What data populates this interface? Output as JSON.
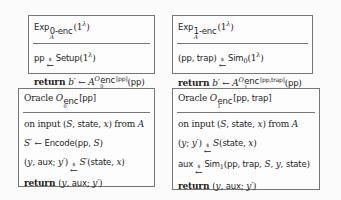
{
  "figure": {
    "colors": {
      "page_bg": "#fbfbfb",
      "box_bg": "#fdfdfd",
      "border": "#767676",
      "ink": "#1f1f1f"
    },
    "boxes": [
      {
        "name": "experiment-0-enc",
        "title": [
          {
            "t": "Exp",
            "c": "sf"
          },
          {
            "k": "stack",
            "c": "",
            "sup": [
              {
                "t": "0-enc",
                "c": "sf"
              }
            ],
            "sub": [
              {
                "t": "A",
                "c": "cal"
              }
            ]
          },
          {
            "t": "(1",
            "c": "rm"
          },
          {
            "t": "λ",
            "c": "sup it"
          },
          {
            "t": ")",
            "c": "rm"
          }
        ],
        "lines": [
          [
            {
              "t": "pp",
              "c": "sf"
            },
            {
              "k": "sarr",
              "t": "$"
            },
            {
              "t": "Setup",
              "c": "sf"
            },
            {
              "t": "(1",
              "c": "rm"
            },
            {
              "t": "λ",
              "c": "sup it"
            },
            {
              "t": ")",
              "c": "rm"
            }
          ],
          [
            {
              "t": "return ",
              "c": "bf"
            },
            {
              "t": "b′",
              "c": "it"
            },
            {
              "t": " ← ",
              "c": "rm"
            },
            {
              "t": "A",
              "c": "cal"
            },
            {
              "t": "O",
              "c": "sup cal"
            },
            {
              "k": "stack",
              "c": "ss hi",
              "sup": [
                {
                  "t": "enc",
                  "c": "sf"
                }
              ],
              "sub": [
                {
                  "t": "0",
                  "c": "rm"
                }
              ]
            },
            {
              "t": "[pp]",
              "c": "sup sf"
            },
            {
              "t": "(",
              "c": "rm"
            },
            {
              "t": "pp",
              "c": "sf"
            },
            {
              "t": ")",
              "c": "rm"
            }
          ]
        ]
      },
      {
        "name": "experiment-1-enc",
        "title": [
          {
            "t": "Exp",
            "c": "sf"
          },
          {
            "k": "stack",
            "c": "",
            "sup": [
              {
                "t": "1-enc",
                "c": "sf"
              }
            ],
            "sub": [
              {
                "t": "A",
                "c": "cal"
              }
            ]
          },
          {
            "t": "(1",
            "c": "rm"
          },
          {
            "t": "λ",
            "c": "sup it"
          },
          {
            "t": ")",
            "c": "rm"
          }
        ],
        "lines": [
          [
            {
              "t": "(",
              "c": "rm"
            },
            {
              "t": "pp, trap",
              "c": "sf"
            },
            {
              "t": ")",
              "c": "rm"
            },
            {
              "k": "sarr",
              "t": "$"
            },
            {
              "t": "Sim",
              "c": "sf"
            },
            {
              "t": "0",
              "c": "sub rm"
            },
            {
              "t": "(1",
              "c": "rm"
            },
            {
              "t": "λ",
              "c": "sup it"
            },
            {
              "t": ")",
              "c": "rm"
            }
          ],
          [
            {
              "t": "return ",
              "c": "bf"
            },
            {
              "t": "b′",
              "c": "it"
            },
            {
              "t": " ← ",
              "c": "rm"
            },
            {
              "t": "A",
              "c": "cal"
            },
            {
              "t": "O",
              "c": "sup cal"
            },
            {
              "k": "stack",
              "c": "ss hi",
              "sup": [
                {
                  "t": "enc",
                  "c": "sf"
                }
              ],
              "sub": [
                {
                  "t": "1",
                  "c": "rm"
                }
              ]
            },
            {
              "t": "[pp,trap]",
              "c": "sup sf"
            },
            {
              "t": "(",
              "c": "rm"
            },
            {
              "t": "pp",
              "c": "sf"
            },
            {
              "t": ")",
              "c": "rm"
            }
          ]
        ]
      },
      {
        "name": "oracle-0-enc",
        "title": [
          {
            "t": "Oracle ",
            "c": "rm"
          },
          {
            "t": "O",
            "c": "cal"
          },
          {
            "k": "stack",
            "c": "ss",
            "sup": [
              {
                "t": "enc",
                "c": "sf"
              }
            ],
            "sub": [
              {
                "t": "0",
                "c": "rm"
              }
            ]
          },
          {
            "t": "[pp]",
            "c": "sf"
          }
        ],
        "lines": [
          [
            {
              "t": "on input (",
              "c": "rm"
            },
            {
              "t": "S",
              "c": "it"
            },
            {
              "t": ", ",
              "c": "rm"
            },
            {
              "t": "state",
              "c": "sf"
            },
            {
              "t": ", ",
              "c": "rm"
            },
            {
              "t": "x",
              "c": "it"
            },
            {
              "t": ") from ",
              "c": "rm"
            },
            {
              "t": "A",
              "c": "cal"
            }
          ],
          [
            {
              "t": "S′",
              "c": "it"
            },
            {
              "t": " ← ",
              "c": "rm"
            },
            {
              "t": "Encode",
              "c": "sf"
            },
            {
              "t": "(",
              "c": "rm"
            },
            {
              "t": "pp",
              "c": "sf"
            },
            {
              "t": ", ",
              "c": "rm"
            },
            {
              "t": "S",
              "c": "it"
            },
            {
              "t": ")",
              "c": "rm"
            }
          ],
          [
            {
              "t": "(",
              "c": "rm"
            },
            {
              "t": "y",
              "c": "it"
            },
            {
              "t": ", ",
              "c": "rm"
            },
            {
              "t": "aux",
              "c": "sf"
            },
            {
              "t": "; ",
              "c": "rm"
            },
            {
              "t": "y′",
              "c": "it"
            },
            {
              "t": ")",
              "c": "rm"
            },
            {
              "k": "sarr",
              "t": "$"
            },
            {
              "t": "S′",
              "c": "it"
            },
            {
              "t": "(",
              "c": "rm"
            },
            {
              "t": "state",
              "c": "sf"
            },
            {
              "t": ", ",
              "c": "rm"
            },
            {
              "t": "x",
              "c": "it"
            },
            {
              "t": ")",
              "c": "rm"
            }
          ],
          [
            {
              "t": "return ",
              "c": "bf"
            },
            {
              "t": "(",
              "c": "rm"
            },
            {
              "t": "y",
              "c": "it"
            },
            {
              "t": ", ",
              "c": "rm"
            },
            {
              "t": "aux",
              "c": "sf"
            },
            {
              "t": "; ",
              "c": "rm"
            },
            {
              "t": "y′",
              "c": "it"
            },
            {
              "t": ")",
              "c": "rm"
            }
          ]
        ]
      },
      {
        "name": "oracle-1-enc",
        "title": [
          {
            "t": "Oracle ",
            "c": "rm"
          },
          {
            "t": "O",
            "c": "cal"
          },
          {
            "k": "stack",
            "c": "ss",
            "sup": [
              {
                "t": "enc",
                "c": "sf"
              }
            ],
            "sub": [
              {
                "t": "1",
                "c": "rm"
              }
            ]
          },
          {
            "t": "[pp, trap]",
            "c": "sf"
          }
        ],
        "lines": [
          [
            {
              "t": "on input (",
              "c": "rm"
            },
            {
              "t": "S",
              "c": "it"
            },
            {
              "t": ", ",
              "c": "rm"
            },
            {
              "t": "state",
              "c": "sf"
            },
            {
              "t": ", ",
              "c": "rm"
            },
            {
              "t": "x",
              "c": "it"
            },
            {
              "t": ") from ",
              "c": "rm"
            },
            {
              "t": "A",
              "c": "cal"
            }
          ],
          [
            {
              "t": "(",
              "c": "rm"
            },
            {
              "t": "y",
              "c": "it"
            },
            {
              "t": "; ",
              "c": "rm"
            },
            {
              "t": "y′",
              "c": "it"
            },
            {
              "t": ")",
              "c": "rm"
            },
            {
              "k": "sarr",
              "t": "$"
            },
            {
              "t": "S",
              "c": "it"
            },
            {
              "t": "(",
              "c": "rm"
            },
            {
              "t": "state",
              "c": "sf"
            },
            {
              "t": ", ",
              "c": "rm"
            },
            {
              "t": "x",
              "c": "it"
            },
            {
              "t": ")",
              "c": "rm"
            }
          ],
          [
            {
              "t": "aux",
              "c": "sf"
            },
            {
              "k": "sarr",
              "t": "$"
            },
            {
              "t": "Sim",
              "c": "sf"
            },
            {
              "t": "1",
              "c": "sub rm"
            },
            {
              "t": "(",
              "c": "rm"
            },
            {
              "t": "pp, trap",
              "c": "sf"
            },
            {
              "t": ", ",
              "c": "rm"
            },
            {
              "t": "S",
              "c": "it"
            },
            {
              "t": ", ",
              "c": "rm"
            },
            {
              "t": "y",
              "c": "it"
            },
            {
              "t": ", ",
              "c": "rm"
            },
            {
              "t": "state",
              "c": "sf"
            },
            {
              "t": ")",
              "c": "rm"
            }
          ],
          [
            {
              "t": "return ",
              "c": "bf"
            },
            {
              "t": "(",
              "c": "rm"
            },
            {
              "t": "y",
              "c": "it"
            },
            {
              "t": ", ",
              "c": "rm"
            },
            {
              "t": "aux",
              "c": "sf"
            },
            {
              "t": "; ",
              "c": "rm"
            },
            {
              "t": "y′",
              "c": "it"
            },
            {
              "t": ")",
              "c": "rm"
            }
          ]
        ]
      }
    ]
  }
}
